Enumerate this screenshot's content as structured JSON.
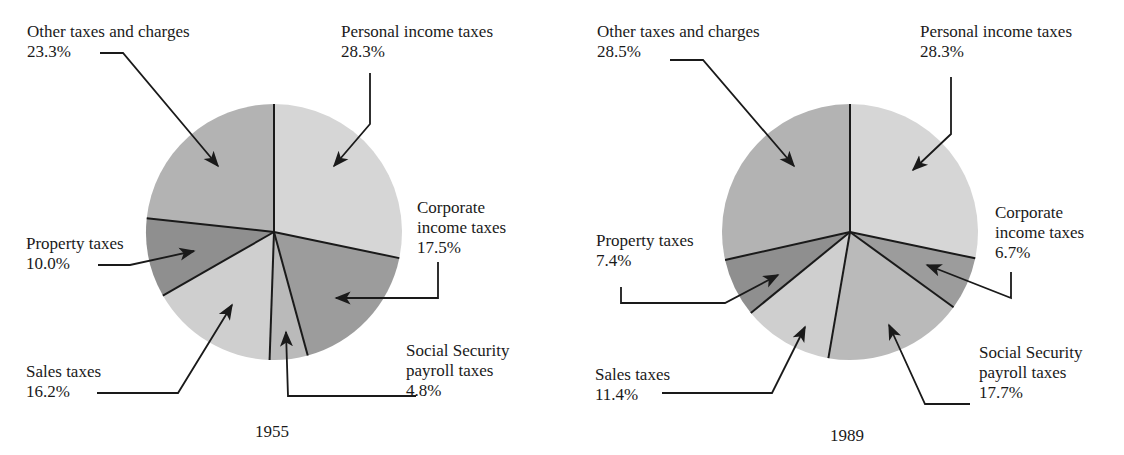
{
  "chart_data": [
    {
      "type": "pie",
      "title": "1955",
      "start_angle_deg": 0,
      "direction": "clockwise",
      "center": [
        274,
        232
      ],
      "radius": 128,
      "slices": [
        {
          "key": "personal",
          "label": "Personal income taxes",
          "value": 28.3,
          "value_label": "28.3%",
          "color": "#d6d6d6"
        },
        {
          "key": "corporate",
          "label": "Corporate income taxes",
          "value": 17.5,
          "value_label": "17.5%",
          "color": "#9c9c9c"
        },
        {
          "key": "social",
          "label": "Social Security payroll taxes",
          "value": 4.8,
          "value_label": "4.8%",
          "color": "#bababa"
        },
        {
          "key": "sales",
          "label": "Sales taxes",
          "value": 16.2,
          "value_label": "16.2%",
          "color": "#cfcfcf"
        },
        {
          "key": "property",
          "label": "Property taxes",
          "value": 10.0,
          "value_label": "10.0%",
          "color": "#8f8f8f"
        },
        {
          "key": "other",
          "label": "Other taxes and charges",
          "value": 23.3,
          "value_label": "23.3%",
          "color": "#b3b3b3"
        }
      ]
    },
    {
      "type": "pie",
      "title": "1989",
      "start_angle_deg": 0,
      "direction": "clockwise",
      "center": [
        850,
        232
      ],
      "radius": 128,
      "slices": [
        {
          "key": "personal",
          "label": "Personal income taxes",
          "value": 28.3,
          "value_label": "28.3%",
          "color": "#d6d6d6"
        },
        {
          "key": "corporate",
          "label": "Corporate income taxes",
          "value": 6.7,
          "value_label": "6.7%",
          "color": "#9c9c9c"
        },
        {
          "key": "social",
          "label": "Social Security payroll taxes",
          "value": 17.7,
          "value_label": "17.7%",
          "color": "#bababa"
        },
        {
          "key": "sales",
          "label": "Sales taxes",
          "value": 11.4,
          "value_label": "11.4%",
          "color": "#cfcfcf"
        },
        {
          "key": "property",
          "label": "Property taxes",
          "value": 7.4,
          "value_label": "7.4%",
          "color": "#8f8f8f"
        },
        {
          "key": "other",
          "label": "Other taxes and charges",
          "value": 28.5,
          "value_label": "28.5%",
          "color": "#b3b3b3"
        }
      ]
    }
  ],
  "labels": {
    "p1955": {
      "other_l1": "Other taxes and charges",
      "other_l2": "23.3%",
      "personal_l1": "Personal income taxes",
      "personal_l2": "28.3%",
      "corporate_l1": "Corporate",
      "corporate_l2": "income taxes",
      "corporate_l3": "17.5%",
      "property_l1": "Property taxes",
      "property_l2": "10.0%",
      "sales_l1": "Sales taxes",
      "sales_l2": "16.2%",
      "social_l1": "Social Security",
      "social_l2": "payroll taxes",
      "social_l3": "4.8%",
      "year": "1955"
    },
    "p1989": {
      "other_l1": "Other taxes and charges",
      "other_l2": "28.5%",
      "personal_l1": "Personal income taxes",
      "personal_l2": "28.3%",
      "corporate_l1": "Corporate",
      "corporate_l2": "income taxes",
      "corporate_l3": "6.7%",
      "property_l1": "Property taxes",
      "property_l2": "7.4%",
      "sales_l1": "Sales taxes",
      "sales_l2": "11.4%",
      "social_l1": "Social Security",
      "social_l2": "payroll taxes",
      "social_l3": "17.7%",
      "year": "1989"
    }
  },
  "leaders": [
    {
      "points": [
        [
          100,
          53
        ],
        [
          123,
          53
        ],
        [
          218,
          166
        ]
      ]
    },
    {
      "points": [
        [
          370,
          73
        ],
        [
          370,
          124
        ],
        [
          334,
          166
        ]
      ]
    },
    {
      "points": [
        [
          438,
          262
        ],
        [
          438,
          298
        ],
        [
          336,
          298
        ]
      ]
    },
    {
      "points": [
        [
          98,
          265
        ],
        [
          130,
          265
        ],
        [
          194,
          251
        ]
      ]
    },
    {
      "points": [
        [
          97,
          393
        ],
        [
          178,
          393
        ],
        [
          232,
          305
        ]
      ]
    },
    {
      "points": [
        [
          416,
          396
        ],
        [
          288,
          396
        ],
        [
          286,
          332
        ]
      ]
    },
    {
      "points": [
        [
          670,
          60
        ],
        [
          703,
          60
        ],
        [
          794,
          166
        ]
      ]
    },
    {
      "points": [
        [
          951,
          77
        ],
        [
          951,
          134
        ],
        [
          913,
          170
        ]
      ]
    },
    {
      "points": [
        [
          1011,
          272
        ],
        [
          1011,
          298
        ],
        [
          927,
          265
        ]
      ]
    },
    {
      "points": [
        [
          621,
          287
        ],
        [
          621,
          303
        ],
        [
          725,
          303
        ],
        [
          778,
          275
        ]
      ]
    },
    {
      "points": [
        [
          662,
          393
        ],
        [
          772,
          393
        ],
        [
          805,
          327
        ]
      ]
    },
    {
      "points": [
        [
          970,
          404
        ],
        [
          925,
          404
        ],
        [
          889,
          325
        ]
      ]
    }
  ]
}
